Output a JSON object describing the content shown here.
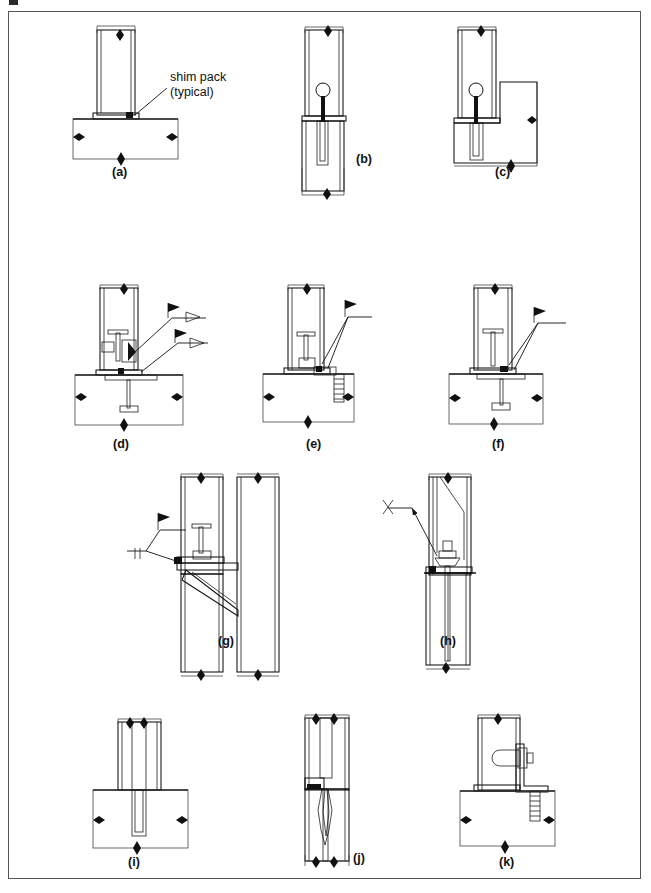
{
  "figure": {
    "border_color": "#555555",
    "line_color": "#111111",
    "background": "#ffffff",
    "annotation": {
      "line1": "shim pack",
      "line2": "(typical)"
    },
    "captions": [
      {
        "id": "a",
        "label": "(a)",
        "x": 126,
        "y": 176
      },
      {
        "id": "b",
        "label": "(b)",
        "x": 356,
        "y": 163
      },
      {
        "id": "c",
        "label": "(c)",
        "x": 500,
        "y": 176
      },
      {
        "id": "d",
        "label": "(d)",
        "x": 117,
        "y": 448
      },
      {
        "id": "e",
        "label": "(e)",
        "x": 310,
        "y": 448
      },
      {
        "id": "f",
        "label": "(f)",
        "x": 497,
        "y": 448
      },
      {
        "id": "g",
        "label": "(g)",
        "x": 224,
        "y": 645
      },
      {
        "id": "h",
        "label": "(h)",
        "x": 446,
        "y": 645
      },
      {
        "id": "i",
        "label": "(i)",
        "x": 133,
        "y": 866
      },
      {
        "id": "j",
        "label": "(j)",
        "x": 358,
        "y": 862
      },
      {
        "id": "k",
        "label": "(k)",
        "x": 504,
        "y": 866
      }
    ],
    "detail_count": 11
  }
}
